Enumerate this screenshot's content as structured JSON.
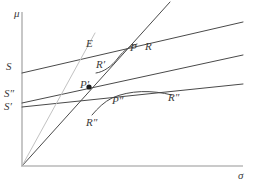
{
  "figure": {
    "axes": {
      "y_label": "μ",
      "x_label": "σ",
      "axis_color": "#b9b9b9",
      "origin": {
        "x": 22,
        "y": 166
      },
      "y_top": 12,
      "x_right": 243
    },
    "style": {
      "line_color": "#4a4a4a",
      "light_line_color": "#c2c2c2",
      "point_color": "#1a1a1a",
      "text_color": "#3a3a3a"
    },
    "labels": [
      {
        "name": "y-axis-label",
        "text": "μ",
        "x": 14,
        "y": 8,
        "kind": "axis"
      },
      {
        "name": "x-axis-label",
        "text": "σ",
        "x": 238,
        "y": 170,
        "kind": "axis"
      },
      {
        "name": "intercept-label-s",
        "text": "S",
        "x": 6,
        "y": 61,
        "kind": "intercept"
      },
      {
        "name": "intercept-label-s2",
        "text": "S″",
        "x": 4,
        "y": 88,
        "kind": "intercept"
      },
      {
        "name": "intercept-label-s1",
        "text": "S′",
        "x": 4,
        "y": 101,
        "kind": "intercept"
      },
      {
        "name": "point-label-e",
        "text": "E",
        "x": 86,
        "y": 38,
        "kind": "point"
      },
      {
        "name": "point-label-p",
        "text": "P",
        "x": 130,
        "y": 42,
        "kind": "point"
      },
      {
        "name": "curve-label-r",
        "text": "R",
        "x": 145,
        "y": 41,
        "kind": "point"
      },
      {
        "name": "curve-label-r-mid",
        "text": "R′",
        "x": 96,
        "y": 59,
        "kind": "point"
      },
      {
        "name": "point-label-p1",
        "text": "P′",
        "x": 80,
        "y": 79,
        "kind": "point"
      },
      {
        "name": "point-label-p2",
        "text": "P″",
        "x": 112,
        "y": 95,
        "kind": "point"
      },
      {
        "name": "curve-label-r2-right",
        "text": "R″",
        "x": 168,
        "y": 92,
        "kind": "point"
      },
      {
        "name": "curve-label-r2-left",
        "text": "R″",
        "x": 86,
        "y": 117,
        "kind": "point"
      }
    ],
    "lines": [
      {
        "name": "line-s",
        "kind": "straight",
        "from": [
          22,
          73
        ],
        "to": [
          243,
          22
        ],
        "weight": 1,
        "color": "#4a4a4a"
      },
      {
        "name": "line-s-double",
        "kind": "straight",
        "from": [
          22,
          103
        ],
        "to": [
          243,
          55
        ],
        "weight": 1,
        "color": "#4a4a4a"
      },
      {
        "name": "line-s-prime",
        "kind": "straight",
        "from": [
          22,
          107
        ],
        "to": [
          243,
          84
        ],
        "weight": 1,
        "color": "#4a4a4a"
      },
      {
        "name": "ray-efficient",
        "kind": "straight",
        "from": [
          22,
          166
        ],
        "to": [
          170,
          2
        ],
        "weight": 1,
        "color": "#4a4a4a"
      },
      {
        "name": "ray-light",
        "kind": "straight",
        "from": [
          22,
          166
        ],
        "to": [
          95,
          33
        ],
        "weight": 1,
        "color": "#c2c2c2"
      }
    ],
    "curves": [
      {
        "name": "curve-r-upper",
        "path": "M 96 73 C 104 72 112 66 118 58 C 124 50 130 46 137 44",
        "color": "#4a4a4a"
      },
      {
        "name": "curve-r-lower",
        "path": "M 92 115 C 98 108 104 102 112 98 C 130 90 152 90 172 95",
        "color": "#4a4a4a"
      }
    ],
    "points": [
      {
        "name": "point-marker-p-prime",
        "x": 89,
        "y": 87,
        "r": 2.6,
        "color": "#1a1a1a"
      }
    ]
  }
}
